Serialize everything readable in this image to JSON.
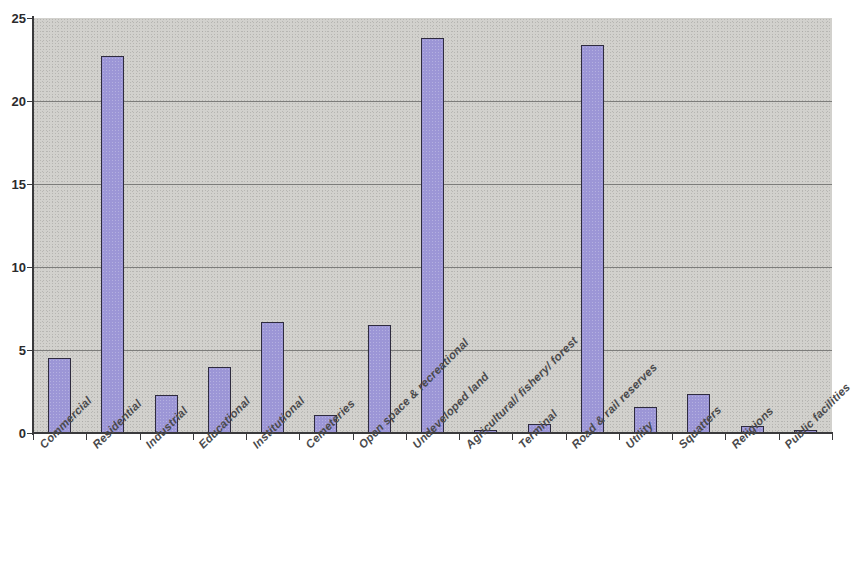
{
  "chart_data": {
    "type": "bar",
    "title": "",
    "subtitle": "",
    "xlabel": "",
    "ylabel": "",
    "ylim": [
      0,
      25
    ],
    "xlim_note": "categorical",
    "grid": true,
    "gridlines_y": [
      0,
      5,
      10,
      15,
      20,
      25
    ],
    "y_tick_labels": [
      "0",
      "5",
      "10",
      "15",
      "20",
      "25"
    ],
    "legend": null,
    "legend_position": "none",
    "bar_fill_color": "#9c96d6",
    "bar_border_color": "#2e2b3e",
    "plot_background_color": "#d2d1cd",
    "categories": [
      "Commercial",
      "Residential",
      "Industrial",
      "Educational",
      "Institutional",
      "Cemeteries",
      "Open space & recreational",
      "Undeveloped land",
      "Agricultural/ fishery/ forest",
      "Terminal",
      "Road & rail reserves",
      "Utility",
      "Squatters",
      "Religions",
      "Public facilities"
    ],
    "values": [
      4.5,
      22.7,
      2.3,
      4.0,
      6.7,
      1.1,
      6.5,
      23.8,
      0.1,
      0.55,
      23.4,
      1.55,
      2.35,
      0.45,
      0.15
    ]
  },
  "axis": {
    "y_ticks": [
      {
        "label": "25",
        "value": 25
      },
      {
        "label": "20",
        "value": 20
      },
      {
        "label": "15",
        "value": 15
      },
      {
        "label": "10",
        "value": 10
      },
      {
        "label": "5",
        "value": 5
      },
      {
        "label": "0",
        "value": 0
      }
    ]
  }
}
